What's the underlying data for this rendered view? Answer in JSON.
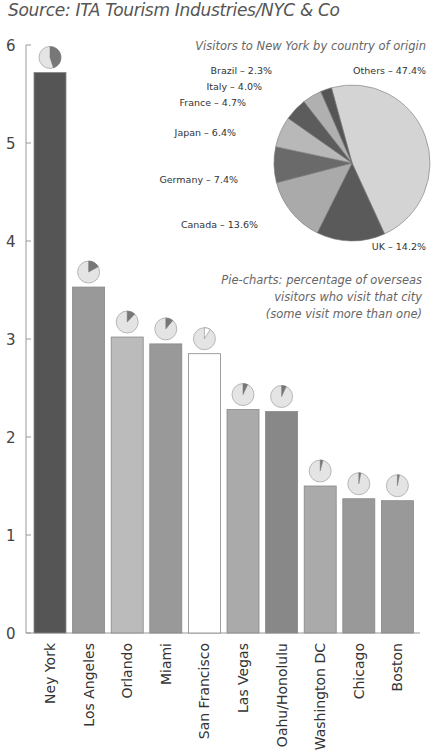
{
  "header": {
    "source": "Source: ITA Tourism Industries/NYC & Co"
  },
  "chart_data": [
    {
      "type": "bar",
      "title": "",
      "subtitle": "Source: ITA Tourism Industries/NYC & Co",
      "xlabel": "",
      "ylabel": "",
      "ylim": [
        0,
        6
      ],
      "yticks": [
        0,
        1,
        2,
        3,
        4,
        5,
        6
      ],
      "grid": false,
      "categories": [
        "Ney York",
        "Los Angeles",
        "Orlando",
        "Miami",
        "San Francisco",
        "Las Vegas",
        "Oahu/Honolulu",
        "Washington DC",
        "Chicago",
        "Boston"
      ],
      "values": [
        5.72,
        3.53,
        3.02,
        2.95,
        2.85,
        2.28,
        2.26,
        1.5,
        1.37,
        1.35
      ],
      "colors": [
        "#555555",
        "#999999",
        "#bbbbbb",
        "#999999",
        "#ffffff",
        "#aaaaaa",
        "#888888",
        "#aaaaaa",
        "#999999",
        "#999999"
      ],
      "inset_pie_percent_of_overseas_visitors": [
        45,
        17,
        12,
        11,
        9,
        7,
        7,
        4,
        3,
        3
      ],
      "annotation": [
        "Pie-charts: percentage of overseas",
        "visitors who visit that city",
        "(some visit more than one)"
      ]
    },
    {
      "type": "pie",
      "title": "Visitors to New York by country of origin",
      "labels": [
        "Others",
        "UK",
        "Canada",
        "Germany",
        "Japan",
        "France",
        "Italy",
        "Brazil"
      ],
      "values": [
        47.4,
        14.2,
        13.6,
        7.4,
        6.4,
        4.7,
        4.0,
        2.3
      ],
      "label_text": [
        "Others – 47.4%",
        "UK – 14.2%",
        "Canada – 13.6%",
        "Germany – 7.4%",
        "Japan – 6.4%",
        "France – 4.7%",
        "Italy – 4.0%",
        "Brazil – 2.3%"
      ],
      "colors": [
        "#d4d4d4",
        "#5a5a5a",
        "#aaaaaa",
        "#6a6a6a",
        "#b8b8b8",
        "#5c5c5c",
        "#b0b0b0",
        "#555555"
      ]
    }
  ]
}
